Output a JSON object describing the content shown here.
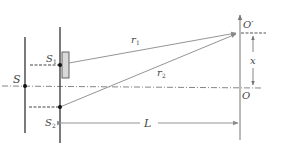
{
  "diagram": {
    "labels": {
      "source": "S",
      "slit1": "S",
      "slit1_sub": "1",
      "slit2": "S",
      "slit2_sub": "2",
      "path1": "r",
      "path1_sub": "1",
      "path2": "r",
      "path2_sub": "2",
      "distance": "L",
      "displacement": "x",
      "center_point": "O",
      "observation_point": "O′"
    },
    "colors": {
      "line": "#555555",
      "light_ray": "#8a8a8a",
      "plate_fill": "#d9d9d9",
      "plate_stroke": "#555555",
      "dot": "#111111"
    }
  }
}
